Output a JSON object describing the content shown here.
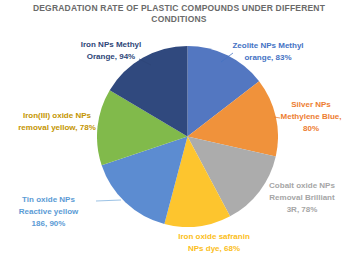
{
  "title": "DEGRADATION RATE OF PLASTIC COMPOUNDS UNDER DIFFERENT CONDITIONS",
  "chart_data": {
    "type": "pie",
    "title": "DEGRADATION RATE OF PLASTIC COMPOUNDS UNDER DIFFERENT CONDITIONS",
    "legend": "none",
    "data_labels": "outside, category name + percent value",
    "start_angle_deg": 0,
    "direction": "clockwise",
    "slices": [
      {
        "label": "Zeolite NPs Methyl orange",
        "value": 83,
        "color": "#5377C1",
        "label_color": "#4472C4",
        "display": "Zeolite NPs Methyl\norange, 83%"
      },
      {
        "label": "Silver NPs Methylene Blue",
        "value": 80,
        "color": "#F0923B",
        "label_color": "#ED7D31",
        "display": "Silver NPs\nMethylene Blue,\n80%"
      },
      {
        "label": "Cobalt oxide NPs Removal Brilliant 3R",
        "value": 78,
        "color": "#ACACAC",
        "label_color": "#A6A6A6",
        "display": "Cobalt oxide NPs\nRemoval Brilliant\n3R, 78%"
      },
      {
        "label": "Iron oxide safranin NPs dye",
        "value": 68,
        "color": "#FDC52E",
        "label_color": "#FBBE20",
        "display": "Iron oxide safranin\nNPs dye, 68%"
      },
      {
        "label": "Tin oxide NPs Reactive yellow 186",
        "value": 90,
        "color": "#5C8CD1",
        "label_color": "#5B9BD5",
        "display": "Tin oxide NPs\nReactive yellow\n186, 90%"
      },
      {
        "label": "Iron(III) oxide NPs removal yellow",
        "value": 78,
        "color": "#81BA4B",
        "label_color": "#C49500",
        "display": "Iron(III) oxide NPs\nremoval yellow, 78%"
      },
      {
        "label": "Iron NPs Methyl Orange",
        "value": 94,
        "color": "#30497E",
        "label_color": "#2E4678",
        "display": "Iron NPs Methyl\nOrange, 94%"
      }
    ]
  }
}
